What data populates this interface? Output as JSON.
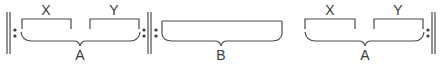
{
  "diagram": {
    "type": "musical-form-structure",
    "colors": {
      "stroke": "#4a4a4a",
      "text": "#3a3a3a"
    },
    "sections": [
      {
        "label": "A",
        "subsections": [
          {
            "label": "X"
          },
          {
            "label": "Y"
          }
        ],
        "repeat": "both-ends"
      },
      {
        "label": "B",
        "subsections": [],
        "repeat": "start"
      },
      {
        "label": "A",
        "subsections": [
          {
            "label": "X"
          },
          {
            "label": "Y"
          }
        ],
        "repeat": "end"
      }
    ]
  }
}
